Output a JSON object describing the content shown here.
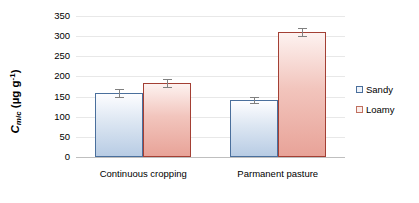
{
  "chart_data": {
    "type": "bar",
    "title": "",
    "xlabel": "",
    "ylabel": "C_mic (µg g-1)",
    "ylabel_parts": {
      "main": "C",
      "subscript": "mic",
      "unit_open": " (µg g",
      "unit_exp": "-1",
      "unit_close": ")"
    },
    "categories": [
      "Continuous cropping",
      "Parmanent pasture"
    ],
    "series": [
      {
        "name": "Sandy",
        "color": "#b8cce4",
        "border_color": "#4a6f9c",
        "values": [
          158,
          142
        ],
        "errors": [
          10,
          7
        ]
      },
      {
        "name": "Loamy",
        "color": "#e8a398",
        "border_color": "#a33f34",
        "values": [
          183,
          310
        ],
        "errors": [
          10,
          10
        ]
      }
    ],
    "ylim": [
      0,
      350
    ],
    "ytick_values": [
      0,
      50,
      100,
      150,
      200,
      250,
      300,
      350
    ],
    "ytick_labels": [
      "0",
      "50",
      "100",
      "150",
      "200",
      "250",
      "300",
      "350"
    ],
    "grid": true,
    "legend_position": "right"
  },
  "legend": {
    "items": [
      {
        "label": "Sandy"
      },
      {
        "label": "Loamy"
      }
    ]
  }
}
